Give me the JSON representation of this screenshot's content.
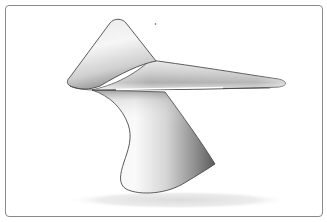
{
  "image": {
    "subject": "sculptural-object-render",
    "description": "Rendered white sculptural form: a triangular top plate with a long tapering arm, supported by a curved pedestal, with a soft ground shadow, inside a rounded frame",
    "colors": {
      "background": "#ffffff",
      "frame_border": "#8a8a8a",
      "outline": "#4a4a4a",
      "surface_light": "#f4f4f4",
      "surface_mid": "#c8c8c8",
      "surface_dark": "#6e6e6e",
      "shadow": "#e6e6e6",
      "highlight": "#ffffff"
    }
  }
}
